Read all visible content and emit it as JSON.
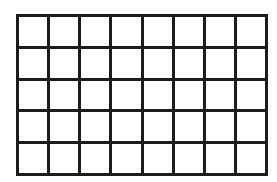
{
  "figure": {
    "kind": "rectangular-grid",
    "columns": 8,
    "rows": 5,
    "cell_count": 40,
    "has_labels": false,
    "has_text": false,
    "filled_cells": 0,
    "geometry": {
      "left_px": 16,
      "top_px": 14,
      "width_px": 252,
      "height_px": 162,
      "cell_width_px": 31.5,
      "cell_height_px": 32.4,
      "line_thickness_px": 3
    },
    "colors": {
      "line": "#1c1c1c",
      "cell_fill": "#ffffff",
      "page_background": "#ffffff"
    }
  },
  "cells": [
    [
      {
        "id": "r1c1",
        "label": ""
      },
      {
        "id": "r1c2",
        "label": ""
      },
      {
        "id": "r1c3",
        "label": ""
      },
      {
        "id": "r1c4",
        "label": ""
      },
      {
        "id": "r1c5",
        "label": ""
      },
      {
        "id": "r1c6",
        "label": ""
      },
      {
        "id": "r1c7",
        "label": ""
      },
      {
        "id": "r1c8",
        "label": ""
      }
    ],
    [
      {
        "id": "r2c1",
        "label": ""
      },
      {
        "id": "r2c2",
        "label": ""
      },
      {
        "id": "r2c3",
        "label": ""
      },
      {
        "id": "r2c4",
        "label": ""
      },
      {
        "id": "r2c5",
        "label": ""
      },
      {
        "id": "r2c6",
        "label": ""
      },
      {
        "id": "r2c7",
        "label": ""
      },
      {
        "id": "r2c8",
        "label": ""
      }
    ],
    [
      {
        "id": "r3c1",
        "label": ""
      },
      {
        "id": "r3c2",
        "label": ""
      },
      {
        "id": "r3c3",
        "label": ""
      },
      {
        "id": "r3c4",
        "label": ""
      },
      {
        "id": "r3c5",
        "label": ""
      },
      {
        "id": "r3c6",
        "label": ""
      },
      {
        "id": "r3c7",
        "label": ""
      },
      {
        "id": "r3c8",
        "label": ""
      }
    ],
    [
      {
        "id": "r4c1",
        "label": ""
      },
      {
        "id": "r4c2",
        "label": ""
      },
      {
        "id": "r4c3",
        "label": ""
      },
      {
        "id": "r4c4",
        "label": ""
      },
      {
        "id": "r4c5",
        "label": ""
      },
      {
        "id": "r4c6",
        "label": ""
      },
      {
        "id": "r4c7",
        "label": ""
      },
      {
        "id": "r4c8",
        "label": ""
      }
    ],
    [
      {
        "id": "r5c1",
        "label": ""
      },
      {
        "id": "r5c2",
        "label": ""
      },
      {
        "id": "r5c3",
        "label": ""
      },
      {
        "id": "r5c4",
        "label": ""
      },
      {
        "id": "r5c5",
        "label": ""
      },
      {
        "id": "r5c6",
        "label": ""
      },
      {
        "id": "r5c7",
        "label": ""
      },
      {
        "id": "r5c8",
        "label": ""
      }
    ]
  ]
}
